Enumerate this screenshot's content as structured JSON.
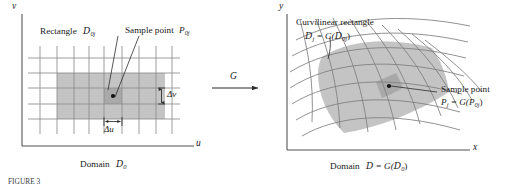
{
  "figure": {
    "title_caption": "FIGURE 3",
    "left_panel": {
      "axis_v": "v",
      "axis_u": "u",
      "label_rectangle": "Rectangle",
      "label_rectangle_sym": "D",
      "label_rectangle_sub": "0j",
      "label_sample_point": "Sample point",
      "label_sample_point_sym": "P",
      "label_sample_point_sub": "0j",
      "label_delta_v": "Δv",
      "label_delta_u": "Δu",
      "label_domain": "Domain",
      "label_domain_sym": "D",
      "label_domain_sub": "0"
    },
    "map_arrow": {
      "label": "G"
    },
    "right_panel": {
      "axis_y": "y",
      "axis_x": "x",
      "label_curvilinear": "Curvilinear rectangle",
      "label_curvilinear_eq_lhs": "D",
      "label_curvilinear_eq_lhs_sub": "j",
      "label_curvilinear_eq_mid": " = G(",
      "label_curvilinear_eq_rhs": "D",
      "label_curvilinear_eq_rhs_sub": "0j",
      "label_curvilinear_eq_close": ")",
      "label_sample_point": "Sample point",
      "label_sample_point_eq_lhs": "P",
      "label_sample_point_eq_lhs_sub": "j",
      "label_sample_point_eq_mid": " = G(",
      "label_sample_point_eq_rhs": "P",
      "label_sample_point_eq_rhs_sub": "0j",
      "label_sample_point_eq_close": ")",
      "label_domain": "Domain",
      "label_domain_sym": "D",
      "label_domain_eq": " = G(",
      "label_domain_rhs": "D",
      "label_domain_rhs_sub": "0",
      "label_domain_close": ")"
    },
    "colors": {
      "shade_fill": "#c4c4c4",
      "cell_fill": "#a8a8a8",
      "grid_stroke": "#8c8c8c",
      "axis_stroke": "#555555",
      "ink": "#1a1a1a"
    }
  }
}
